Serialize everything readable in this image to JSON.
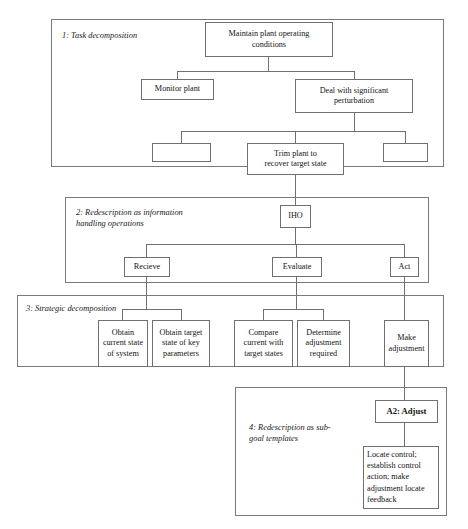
{
  "figure": {
    "type": "hierarchical-decomposition-diagram",
    "panel_count": 4,
    "line_color": "#6f6f6e",
    "background": "#ffffff"
  },
  "panels": [
    {
      "id": "panel-1",
      "label": "1: Task decomposition",
      "boxes": [
        {
          "id": "maintain-plant",
          "text": "Maintain plant operating\nconditions"
        },
        {
          "id": "monitor-plant",
          "text": "Monitor plant"
        },
        {
          "id": "deal-with-perturbation",
          "text": "Deal with significant\nperturbation"
        },
        {
          "id": "empty-left",
          "text": ""
        },
        {
          "id": "trim-plant",
          "text": "Trim plant to\nrecover target state"
        },
        {
          "id": "empty-right",
          "text": ""
        }
      ]
    },
    {
      "id": "panel-2",
      "label": "2: Redescription as information\n    handling operations",
      "boxes": [
        {
          "id": "iho",
          "text": "IHO"
        },
        {
          "id": "recieve",
          "text": "Recieve"
        },
        {
          "id": "evaluate",
          "text": "Evaluate"
        },
        {
          "id": "act",
          "text": "Act"
        }
      ]
    },
    {
      "id": "panel-3",
      "label": "3: Strategic decomposition",
      "boxes": [
        {
          "id": "obtain-current-state",
          "text": "Obtain\ncurrent state\nof system"
        },
        {
          "id": "obtain-target-state",
          "text": "Obtain target\nstate of key\nparameters"
        },
        {
          "id": "compare-current-target",
          "text": "Compare\ncurrent with\ntarget states"
        },
        {
          "id": "determine-adjustment",
          "text": "Determine\nadjustment\nrequired"
        },
        {
          "id": "make-adjustment",
          "text": "Make\nadjustment"
        }
      ]
    },
    {
      "id": "panel-4",
      "label": "4: Redescription as sub-\n    goal templates",
      "boxes": [
        {
          "id": "a2-adjust",
          "text": "A2: Adjust"
        },
        {
          "id": "locate-control",
          "text": "Locate control;\nestablish control\naction; make\nadjustment locate\nfeedback"
        }
      ]
    }
  ]
}
